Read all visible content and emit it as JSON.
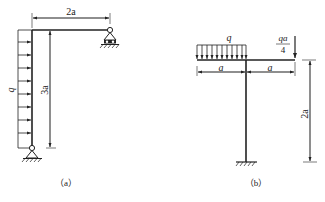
{
  "figures": [
    {
      "id": "a",
      "caption": "（a）",
      "structure": "L-shaped frame: vertical column with pin support at base, horizontal beam with roller support at right end",
      "loads": {
        "distributed_label": "q",
        "distributed_direction": "horizontal, pointing right, along full column height"
      },
      "dimensions": {
        "beam_length": "2a",
        "column_height": "3a"
      },
      "supports": [
        "pin-support-bottom",
        "roller-support-right"
      ]
    },
    {
      "id": "b",
      "caption": "（b）",
      "structure": "T-shaped frame: horizontal beam on top of vertical column with fixed support at base",
      "loads": {
        "distributed_label": "q",
        "distributed_direction": "downward, over left half of beam",
        "point_load_numerator": "qa",
        "point_load_denominator": "4",
        "point_load_direction": "downward at right end"
      },
      "dimensions": {
        "left_span": "a",
        "right_span": "a",
        "column_height": "2a"
      },
      "supports": [
        "fixed-support-bottom"
      ]
    }
  ],
  "colors": {
    "line": "#222222",
    "background": "#ffffff"
  }
}
